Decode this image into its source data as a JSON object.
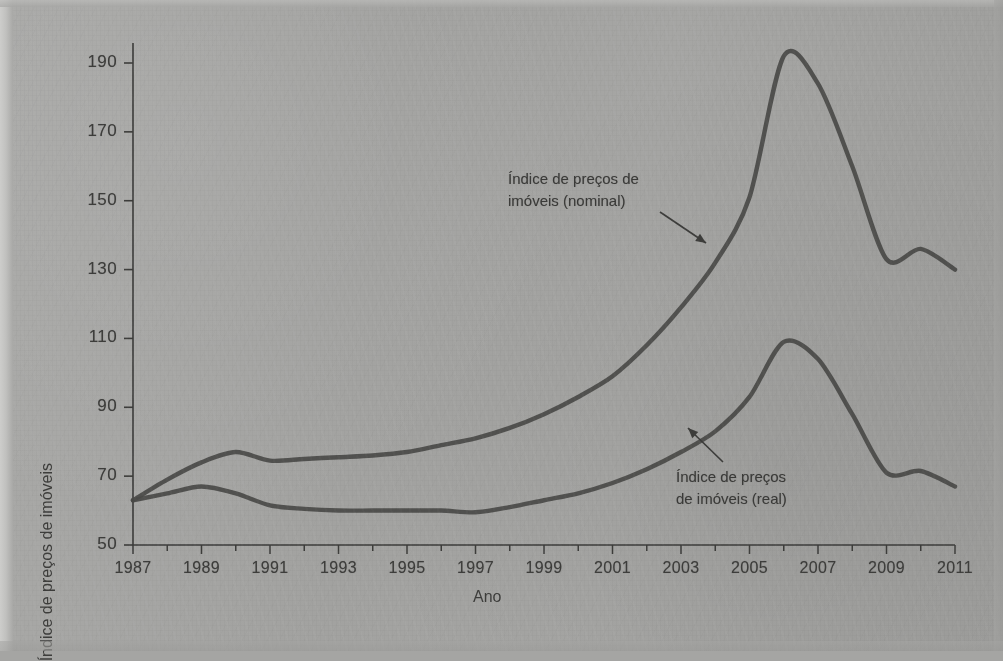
{
  "chart_data": {
    "type": "line",
    "title": "",
    "xlabel": "Ano",
    "ylabel": "Índice de preços de imóveis",
    "xlim": [
      1987,
      2011
    ],
    "ylim": [
      50,
      195
    ],
    "grid": false,
    "legend_position": "inline-annotations",
    "x": [
      1987,
      1988,
      1989,
      1990,
      1991,
      1992,
      1993,
      1994,
      1995,
      1996,
      1997,
      1998,
      1999,
      2000,
      2001,
      2002,
      2003,
      2004,
      2005,
      2006,
      2007,
      2008,
      2009,
      2010,
      2011
    ],
    "xtick_labels": [
      "1987",
      "1989",
      "1991",
      "1993",
      "1995",
      "1997",
      "1999",
      "2001",
      "2003",
      "2005",
      "2007",
      "2009",
      "2011"
    ],
    "xtick_values": [
      1987,
      1989,
      1991,
      1993,
      1995,
      1997,
      1999,
      2001,
      2003,
      2005,
      2007,
      2009,
      2011
    ],
    "ytick_labels": [
      "50",
      "70",
      "90",
      "110",
      "130",
      "150",
      "170",
      "190"
    ],
    "ytick_values": [
      50,
      70,
      90,
      110,
      130,
      150,
      170,
      190
    ],
    "series": [
      {
        "name": "Índice de preços de imóveis (nominal)",
        "color": "#4a4a48",
        "values": [
          63,
          69,
          74,
          77,
          74.5,
          75,
          75.5,
          76,
          77,
          79,
          81,
          84,
          88,
          93,
          99,
          108,
          119,
          132,
          151,
          192,
          184,
          160,
          133,
          136,
          130
        ]
      },
      {
        "name": "Índice de preços de imóveis (real)",
        "color": "#4a4a48",
        "values": [
          63,
          65,
          67,
          65,
          61.5,
          60.5,
          60,
          60,
          60,
          60,
          59.5,
          61,
          63,
          65,
          68,
          72,
          77,
          83,
          93,
          109,
          104,
          88,
          71,
          71.5,
          67
        ]
      }
    ],
    "annotations": [
      {
        "name": "nominal",
        "line1": "Índice de preços de",
        "line2": "imóveis (nominal)",
        "arrow_from": [
          660,
          212
        ],
        "arrow_to": [
          706,
          243
        ]
      },
      {
        "name": "real",
        "line1": "Índice de preços",
        "line2": "de imóveis (real)",
        "arrow_from": [
          723,
          462
        ],
        "arrow_to": [
          688,
          428
        ]
      }
    ]
  },
  "axis": {
    "x_title": "Ano",
    "y_title": "Índice de preços de imóveis"
  },
  "colors": {
    "background": "#a5a5a3",
    "ink": "#3d3d3b",
    "curve": "#4a4a48"
  }
}
